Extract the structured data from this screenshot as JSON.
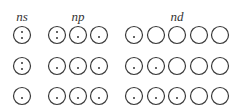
{
  "headers": [
    {
      "label": "ns",
      "x": 22
    },
    {
      "label": "np",
      "x": 78
    },
    {
      "label": "nd",
      "x": 177
    }
  ],
  "style": {
    "stroke": "#3a3a3a",
    "dot": "#333333"
  },
  "rows": [
    {
      "ns": [
        2
      ],
      "np": [
        2,
        1,
        1
      ],
      "nd": [
        1,
        0,
        0,
        0,
        0
      ]
    },
    {
      "ns": [
        2
      ],
      "np": [
        1,
        1,
        1
      ],
      "nd": [
        1,
        1,
        0,
        0,
        0
      ]
    },
    {
      "ns": [
        1
      ],
      "np": [
        1,
        1,
        1
      ],
      "nd": [
        1,
        1,
        1,
        0,
        0
      ]
    }
  ]
}
